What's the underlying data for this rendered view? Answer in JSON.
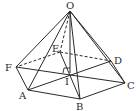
{
  "figure": {
    "type": "hexagonal-pyramid",
    "line_color": "#2a2a2a",
    "background": "#ffffff"
  },
  "points": {
    "O": {
      "label": "O",
      "x": 70,
      "y": 11
    },
    "A": {
      "label": "A",
      "x": 28,
      "y": 90
    },
    "B": {
      "label": "B",
      "x": 80,
      "y": 99
    },
    "C": {
      "label": "C",
      "x": 125,
      "y": 83
    },
    "D": {
      "label": "D",
      "x": 111,
      "y": 61
    },
    "E": {
      "label": "E",
      "x": 60,
      "y": 52
    },
    "F": {
      "label": "F",
      "x": 16,
      "y": 67
    },
    "I": {
      "label": "I",
      "x": 70,
      "y": 73
    }
  },
  "labels": {
    "O": "O",
    "A": "A",
    "B": "B",
    "C": "C",
    "D": "D",
    "E": "E",
    "F": "F",
    "I": "I"
  },
  "edges": {
    "visible": [
      "OA",
      "OB",
      "OC",
      "OD",
      "OF",
      "AB",
      "BC",
      "CD",
      "FA",
      "OI",
      "AD",
      "BF",
      "FC",
      "EB"
    ],
    "hidden": [
      "OE",
      "EF",
      "ED"
    ]
  },
  "annotations": {
    "right_angle_at": "I"
  }
}
